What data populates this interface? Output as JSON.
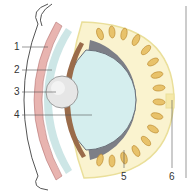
{
  "diagram": {
    "type": "anatomical-cross-section",
    "labels": [
      {
        "id": "1",
        "text": "1",
        "x": 14,
        "y": 42,
        "target": [
          48,
          46
        ]
      },
      {
        "id": "2",
        "text": "2",
        "x": 14,
        "y": 65,
        "target": [
          52,
          70
        ]
      },
      {
        "id": "3",
        "text": "3",
        "x": 14,
        "y": 87,
        "target": [
          56,
          90
        ]
      },
      {
        "id": "4",
        "text": "4",
        "x": 14,
        "y": 110,
        "target": [
          92,
          114
        ]
      },
      {
        "id": "5",
        "text": "5",
        "x": 120,
        "y": 170,
        "target": [
          124,
          148
        ]
      },
      {
        "id": "6",
        "text": "6",
        "x": 170,
        "y": 170,
        "target": [
          172,
          100
        ]
      }
    ],
    "colors": {
      "outer_membrane": "#ffffff",
      "pink_layer": "#e8b4b0",
      "teal_layer": "#cde6e6",
      "brown_layer": "#9a6b4a",
      "sphere": "#e6e6e6",
      "core": "#d5eeee",
      "grey_band": "#7d7f87",
      "cells": "#e8c26a",
      "cell_nucleus": "#b87a2a",
      "halo": "#faf3cf",
      "halo_stroke": "#eadf9a",
      "line": "#555555"
    }
  }
}
